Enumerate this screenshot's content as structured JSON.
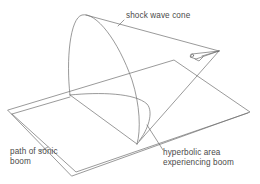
{
  "diagram": {
    "labels": {
      "cone": "shock wave cone",
      "path_line1": "path of sonic",
      "path_line2": "boom",
      "area_line1": "hyperbolic area",
      "area_line2": "experiencing boom"
    },
    "colors": {
      "line": "#6e6e6e",
      "text": "#4a4a4a",
      "background": "#ffffff"
    }
  }
}
